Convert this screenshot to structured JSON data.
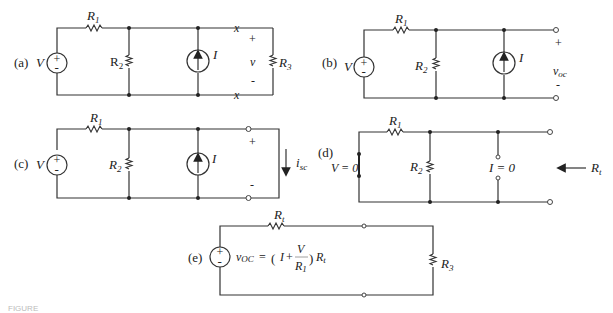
{
  "panels": {
    "a": {
      "label": "(a)",
      "source": "V",
      "source_plus": "+",
      "source_minus": "-",
      "r1": "R",
      "r1_sub": "1",
      "r2": "R",
      "r2_sub": "2",
      "current_source": "I",
      "voltage": "v",
      "plus": "+",
      "minus": "-",
      "r3": "R",
      "r3_sub": "3",
      "cut_mark": "x"
    },
    "b": {
      "label": "(b)",
      "source": "V",
      "source_plus": "+",
      "source_minus": "-",
      "r1": "R",
      "r1_sub": "1",
      "r2": "R",
      "r2_sub": "2",
      "current_source": "I",
      "voltage": "v",
      "voltage_sub": "oc",
      "plus": "+",
      "minus": "-"
    },
    "c": {
      "label": "(c)",
      "source": "V",
      "source_plus": "+",
      "source_minus": "-",
      "r1": "R",
      "r1_sub": "1",
      "r2": "R",
      "r2_sub": "2",
      "current_source": "I",
      "current": "i",
      "current_sub": "sc",
      "plus": "+",
      "minus": "-"
    },
    "d": {
      "label": "(d)",
      "source_zero": "V = 0",
      "r1": "R",
      "r1_sub": "1",
      "r2": "R",
      "r2_sub": "2",
      "current_zero": "I = 0",
      "rt": "R",
      "rt_sub": "t"
    },
    "e": {
      "label": "(e)",
      "source_plus": "+",
      "source_minus": "-",
      "rt": "R",
      "rt_sub": "t",
      "voc_lhs": "v",
      "voc_lhs_sub": "OC",
      "eq": "=",
      "formula_open": "(",
      "formula_I": "I",
      "formula_plus": "+",
      "formula_num": "V",
      "formula_den": "R",
      "formula_den_sub": "1",
      "formula_close": ")",
      "formula_rt": "R",
      "formula_rt_sub": "t",
      "r3": "R",
      "r3_sub": "3"
    }
  },
  "caption": "FIGURE"
}
